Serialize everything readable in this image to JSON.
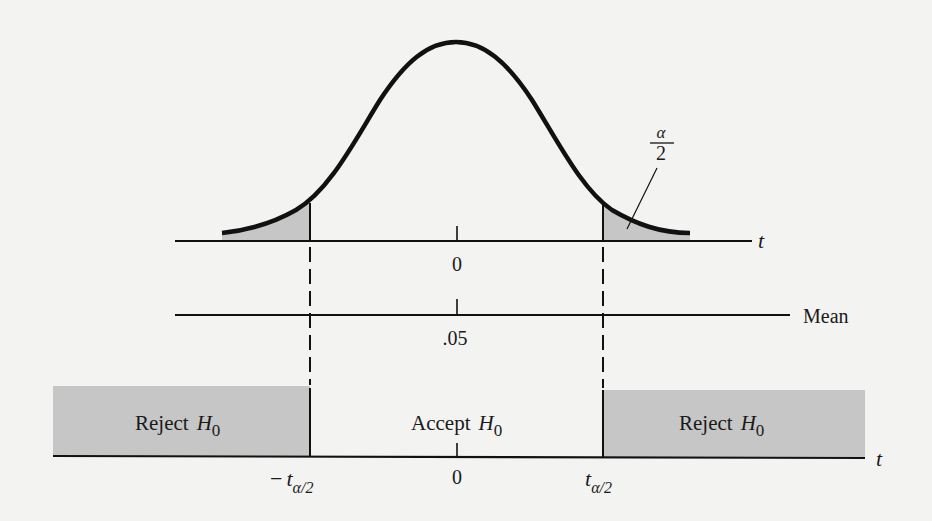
{
  "figure": {
    "colors": {
      "background": "#f3f3f1",
      "ink": "#111111",
      "shade": "#c6c6c6"
    }
  },
  "curve_panel": {
    "axis_label": "t",
    "center_tick_label": "0",
    "tail_area_label": {
      "numerator": "α",
      "denominator": "2"
    },
    "peak": {
      "x": 456,
      "y": 42
    },
    "left_critical_x": 310,
    "right_critical_x": 603
  },
  "mean_panel": {
    "axis_label": "Mean",
    "center_tick_label": ".05"
  },
  "decision_panel": {
    "axis_label": "t",
    "left_region_label": "Reject",
    "center_region_label": "Accept",
    "right_region_label": "Reject",
    "hypothesis_symbol": "H",
    "hypothesis_subscript": "0",
    "left_critical_label": {
      "sign": "−",
      "symbol": "t",
      "subscript": "α/2"
    },
    "center_tick_label": "0",
    "right_critical_label": {
      "symbol": "t",
      "subscript": "α/2"
    }
  }
}
